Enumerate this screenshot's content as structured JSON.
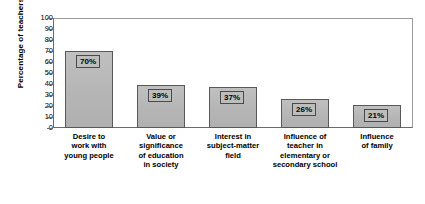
{
  "chart_data": {
    "type": "bar",
    "title": "",
    "xlabel": "",
    "ylabel": "Percentage of teachers",
    "ylim": [
      0,
      100
    ],
    "ytick_step": 10,
    "yticks": [
      100,
      90,
      80,
      70,
      60,
      50,
      40,
      30,
      20,
      10,
      0
    ],
    "ytick_labels": [
      "100",
      "90",
      "80",
      "70",
      "60",
      "50",
      "40",
      "30",
      "20",
      "10",
      "0"
    ],
    "grid": false,
    "legend": "none",
    "bar_color": "#b8b8b8",
    "bar_edge_color": "#585858",
    "categories": [
      "Desire to\nwork with\nyoung people",
      "Value or\nsignificance\nof education\nin society",
      "Interest in\nsubject-matter\nfield",
      "Influence of\nteacher in\nelementary or\nsecondary school",
      "Influence\nof family"
    ],
    "values": [
      70,
      39,
      37,
      26,
      21
    ],
    "value_labels": [
      "70%",
      "39%",
      "37%",
      "26%",
      "21%"
    ]
  }
}
